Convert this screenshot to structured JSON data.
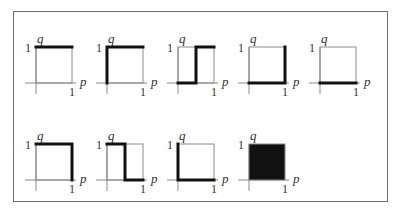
{
  "figure": {
    "axis_labels": {
      "x": "p",
      "y": "q",
      "x_tick": "1",
      "y_tick": "1"
    },
    "colors": {
      "thin": "#8a8a8a",
      "thick": "#111111",
      "fill": "#111111",
      "border": "#6e6e6e"
    },
    "panels": [
      {
        "id": 1,
        "row": 0,
        "col": 0,
        "description": "top edge thick (q=1 for all p)",
        "thick_paths": [
          [
            [
              0,
              1
            ],
            [
              1,
              1
            ]
          ]
        ],
        "filled": false
      },
      {
        "id": 2,
        "row": 0,
        "col": 1,
        "description": "left edge and top edge thick",
        "thick_paths": [
          [
            [
              0,
              0
            ],
            [
              0,
              1
            ],
            [
              1,
              1
            ]
          ]
        ],
        "filled": false
      },
      {
        "id": 3,
        "row": 0,
        "col": 2,
        "description": "step up at p=0.5",
        "thick_paths": [
          [
            [
              0,
              0
            ],
            [
              0.5,
              0
            ],
            [
              0.5,
              1
            ],
            [
              1,
              1
            ]
          ]
        ],
        "filled": false
      },
      {
        "id": 4,
        "row": 0,
        "col": 3,
        "description": "bottom edge and right edge thick",
        "thick_paths": [
          [
            [
              0,
              0
            ],
            [
              1,
              0
            ],
            [
              1,
              1
            ]
          ]
        ],
        "filled": false
      },
      {
        "id": 5,
        "row": 0,
        "col": 4,
        "description": "bottom edge thick (q=0 for all p)",
        "thick_paths": [
          [
            [
              0,
              0
            ],
            [
              1,
              0
            ]
          ]
        ],
        "filled": false
      },
      {
        "id": 6,
        "row": 1,
        "col": 0,
        "description": "top edge and right edge thick",
        "thick_paths": [
          [
            [
              0,
              1
            ],
            [
              1,
              1
            ],
            [
              1,
              0
            ]
          ]
        ],
        "filled": false
      },
      {
        "id": 7,
        "row": 1,
        "col": 1,
        "description": "step down at p=0.5",
        "thick_paths": [
          [
            [
              0,
              1
            ],
            [
              0.5,
              1
            ],
            [
              0.5,
              0
            ],
            [
              1,
              0
            ]
          ]
        ],
        "filled": false
      },
      {
        "id": 8,
        "row": 1,
        "col": 2,
        "description": "left edge and bottom edge thick",
        "thick_paths": [
          [
            [
              0,
              1
            ],
            [
              0,
              0
            ],
            [
              1,
              0
            ]
          ]
        ],
        "filled": false
      },
      {
        "id": 9,
        "row": 1,
        "col": 3,
        "description": "entire unit square filled",
        "thick_paths": [],
        "filled": true
      }
    ]
  }
}
